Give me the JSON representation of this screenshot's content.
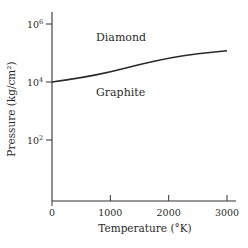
{
  "chart_data": {
    "type": "line",
    "title": "",
    "xlabel": "Temperature (°K)",
    "ylabel": "Pressure (kg/cm²)",
    "xlim": [
      0,
      3000
    ],
    "ylim": [
      1,
      1000000
    ],
    "yscale": "log",
    "grid": false,
    "legend": null,
    "x_ticks": [
      {
        "value": 0,
        "label": "0"
      },
      {
        "value": 1000,
        "label": "1000"
      },
      {
        "value": 2000,
        "label": "2000"
      },
      {
        "value": 3000,
        "label": "3000"
      }
    ],
    "y_ticks": [
      {
        "value": 100,
        "label": "10",
        "sup": "2"
      },
      {
        "value": 10000,
        "label": "10",
        "sup": "4"
      },
      {
        "value": 1000000,
        "label": "10",
        "sup": "6"
      }
    ],
    "series": [
      {
        "name": "Graphite–Diamond phase boundary",
        "x": [
          0,
          500,
          1000,
          1500,
          2000,
          2500,
          3000
        ],
        "y": [
          10000,
          14000,
          22000,
          40000,
          67000,
          95000,
          120000
        ]
      }
    ],
    "annotations": [
      {
        "text": "Diamond",
        "region": "above curve"
      },
      {
        "text": "Graphite",
        "region": "below curve"
      }
    ]
  }
}
